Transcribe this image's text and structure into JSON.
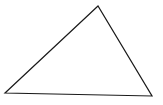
{
  "diagram": {
    "shape": "triangle",
    "stroke_color": "#1a1a1a",
    "fill_color": "#ffffff",
    "vertices": {
      "top": [
        98,
        6
      ],
      "bottom_left": [
        5,
        93
      ],
      "bottom_right": [
        152,
        96
      ]
    },
    "points": "98,6 5,93 152,96"
  }
}
